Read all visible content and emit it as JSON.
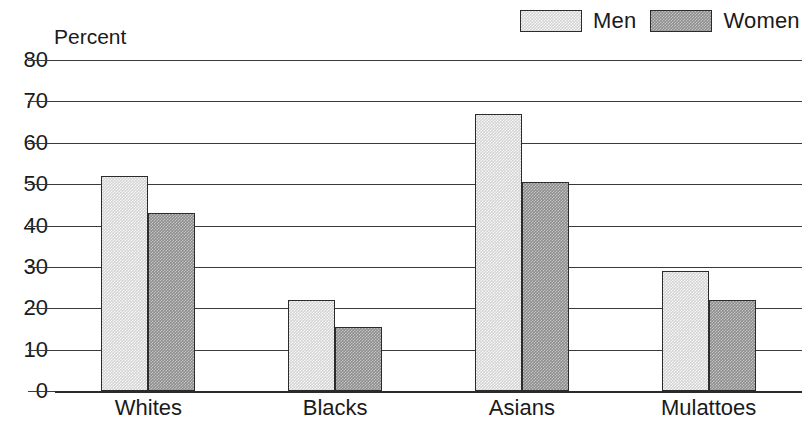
{
  "chart_data": {
    "type": "bar",
    "title": "",
    "xlabel": "",
    "ylabel": "Percent",
    "ylim": [
      0,
      80
    ],
    "yticks": [
      0,
      10,
      20,
      30,
      40,
      50,
      60,
      70,
      80
    ],
    "ytick_labels": [
      "0",
      "10",
      "20",
      "30",
      "40",
      "50",
      "60",
      "70",
      "80"
    ],
    "grid": true,
    "legend_position": "top-right",
    "categories": [
      "Whites",
      "Blacks",
      "Asians",
      "Mulattoes"
    ],
    "series": [
      {
        "name": "Men",
        "color": "#d3d3d3",
        "values": [
          52,
          22,
          67,
          29
        ]
      },
      {
        "name": "Women",
        "color": "#8e8e8e",
        "values": [
          43,
          15.5,
          50.5,
          22
        ]
      }
    ]
  },
  "legend": {
    "entries": [
      {
        "label": "Men",
        "swatch": "men-swatch"
      },
      {
        "label": "Women",
        "swatch": "women-swatch"
      }
    ]
  },
  "axis": {
    "percent_label": "Percent"
  },
  "colors": {
    "men_fill": "#d3d3d3",
    "women_fill": "#8e8e8e",
    "line": "#2b2b2b",
    "background": "#ffffff"
  }
}
